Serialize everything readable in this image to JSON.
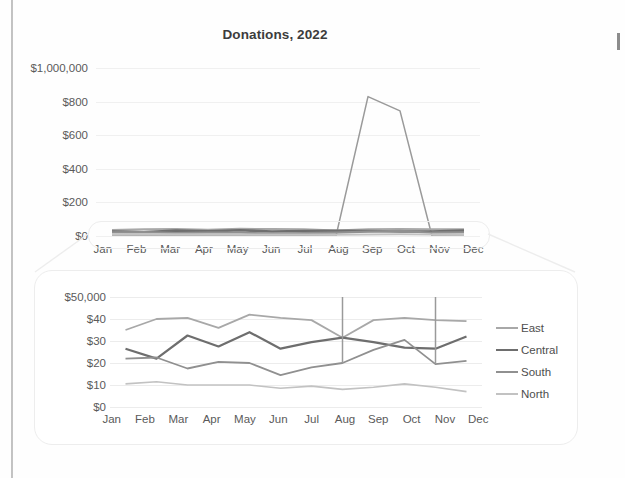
{
  "document": {
    "background_color": "#fefefe",
    "page_edge_color": "#9a9a9a"
  },
  "top_chart": {
    "title": "Donations, 2022",
    "y_tick_labels": [
      "$1,000,000",
      "$800",
      "$600",
      "$400",
      "$200",
      "$0"
    ],
    "x_tick_labels": [
      "Jan",
      "Feb",
      "Mar",
      "Apr",
      "May",
      "Jun",
      "Jul",
      "Aug",
      "Sep",
      "Oct",
      "Nov",
      "Dec"
    ]
  },
  "callout": {
    "highlight_label": "zoom-highlight-region",
    "funnel_label": "magnifier-funnel"
  },
  "zoom_panel": {
    "y_tick_labels": [
      "$50,000",
      "$40",
      "$30",
      "$20",
      "$10",
      "$0"
    ],
    "x_tick_labels": [
      "Jan",
      "Feb",
      "Mar",
      "Apr",
      "May",
      "Jun",
      "Jul",
      "Aug",
      "Sep",
      "Oct",
      "Nov",
      "Dec"
    ]
  },
  "legend": {
    "items": [
      {
        "label": "East",
        "color": "#a8a8a8"
      },
      {
        "label": "Central",
        "color": "#6e6e6e"
      },
      {
        "label": "South",
        "color": "#909090"
      },
      {
        "label": "North",
        "color": "#c2c2c2"
      }
    ]
  },
  "chart_data": [
    {
      "id": "donations-overview",
      "type": "line",
      "title": "Donations, 2022",
      "xlabel": "",
      "ylabel": "",
      "grid": true,
      "legend_position": "none",
      "x": [
        "Jan",
        "Feb",
        "Mar",
        "Apr",
        "May",
        "Jun",
        "Jul",
        "Aug",
        "Sep",
        "Oct",
        "Nov",
        "Dec"
      ],
      "ylim": [
        0,
        1000000
      ],
      "ytick_values": [
        0,
        200000,
        400000,
        600000,
        800000,
        1000000
      ],
      "ytick_labels": [
        "$0",
        "$200",
        "$400",
        "$600",
        "$800",
        "$1,000,000"
      ],
      "note": "Y axis is in thousands; top tick is printed in full as $1,000,000. A huge 'West' style spike in Sep-Oct flattens all four regional series onto the zero line.",
      "series": [
        {
          "name": "Spike",
          "color": "#9a9a9a",
          "values": [
            0,
            0,
            0,
            0,
            0,
            0,
            0,
            0,
            830000,
            745000,
            0,
            0
          ]
        },
        {
          "name": "East",
          "color": "#a8a8a8",
          "values": [
            35000,
            40000,
            40500,
            36000,
            42000,
            40500,
            39500,
            31500,
            39500,
            40500,
            39500,
            39000
          ]
        },
        {
          "name": "Central",
          "color": "#6e6e6e",
          "values": [
            26500,
            22000,
            32500,
            27500,
            34000,
            26500,
            29500,
            31500,
            29500,
            27000,
            26500,
            32000
          ]
        },
        {
          "name": "South",
          "color": "#909090",
          "values": [
            22000,
            22500,
            17500,
            20500,
            20000,
            14500,
            18000,
            20000,
            26000,
            30500,
            19500,
            21000
          ]
        },
        {
          "name": "North",
          "color": "#c2c2c2",
          "values": [
            10500,
            11500,
            10000,
            10000,
            10000,
            8500,
            9500,
            8000,
            9000,
            10500,
            9000,
            7000
          ]
        }
      ]
    },
    {
      "id": "donations-zoom-detail",
      "type": "line",
      "title": "",
      "xlabel": "",
      "ylabel": "",
      "grid": true,
      "legend_position": "right",
      "x": [
        "Jan",
        "Feb",
        "Mar",
        "Apr",
        "May",
        "Jun",
        "Jul",
        "Aug",
        "Sep",
        "Oct",
        "Nov",
        "Dec"
      ],
      "ylim": [
        0,
        50000
      ],
      "ytick_values": [
        0,
        10000,
        20000,
        30000,
        40000,
        50000
      ],
      "ytick_labels": [
        "$0",
        "$10",
        "$20",
        "$30",
        "$40",
        "$50,000"
      ],
      "note": "Magnified view of the $0-$50,000 band. The off-scale Sep-Oct spike appears as clipped vertical lines at Aug and Nov.",
      "series": [
        {
          "name": "East",
          "color": "#a8a8a8",
          "values": [
            35000,
            40000,
            40500,
            36000,
            42000,
            40500,
            39500,
            31500,
            39500,
            40500,
            39500,
            39000
          ]
        },
        {
          "name": "Central",
          "color": "#6e6e6e",
          "values": [
            26500,
            22000,
            32500,
            27500,
            34000,
            26500,
            29500,
            31500,
            29500,
            27000,
            26500,
            32000
          ]
        },
        {
          "name": "South",
          "color": "#909090",
          "values": [
            22000,
            22500,
            17500,
            20500,
            20000,
            14500,
            18000,
            20000,
            26000,
            30500,
            19500,
            21000
          ]
        },
        {
          "name": "North",
          "color": "#c2c2c2",
          "values": [
            10500,
            11500,
            10000,
            10000,
            10000,
            8500,
            9500,
            8000,
            9000,
            10500,
            9000,
            7000
          ]
        },
        {
          "name": "Spike (clipped)",
          "color": "#9a9a9a",
          "values": [
            null,
            null,
            null,
            null,
            null,
            null,
            null,
            50000,
            null,
            null,
            50000,
            null
          ]
        }
      ]
    }
  ]
}
